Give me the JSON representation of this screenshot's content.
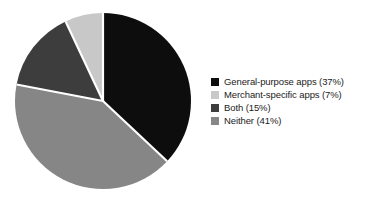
{
  "chart_data": {
    "type": "pie",
    "title": "",
    "subtitle": "",
    "xlabel": "",
    "ylabel": "",
    "legend_position": "right",
    "grid": false,
    "start_angle_deg": 0,
    "direction": "clockwise",
    "categories": [
      "General-purpose apps",
      "Merchant-specific apps",
      "Both",
      "Neither"
    ],
    "values": [
      37,
      7,
      15,
      41
    ],
    "value_unit": "%",
    "slice_order_clockwise_from_top": [
      "General-purpose apps",
      "Neither",
      "Both",
      "Merchant-specific apps"
    ],
    "slices": [
      {
        "label": "General-purpose apps",
        "value": 37,
        "display": "General-purpose apps (37%)",
        "color": "#0d0d0d"
      },
      {
        "label": "Merchant-specific apps",
        "value": 7,
        "display": "Merchant-specific apps (7%)",
        "color": "#c8c8c8"
      },
      {
        "label": "Both",
        "value": 15,
        "display": "Both (15%)",
        "color": "#3d3d3d"
      },
      {
        "label": "Neither",
        "value": 41,
        "display": "Neither (41%)",
        "color": "#868686"
      }
    ],
    "separator_color": "#ffffff",
    "background_color": "#ffffff"
  },
  "legend": {
    "items": [
      {
        "text": "General-purpose apps (37%)",
        "swatch_name": "legend-swatch-general-purpose-apps"
      },
      {
        "text": "Merchant-specific apps (7%)",
        "swatch_name": "legend-swatch-merchant-specific-apps"
      },
      {
        "text": "Both (15%)",
        "swatch_name": "legend-swatch-both"
      },
      {
        "text": "Neither (41%)",
        "swatch_name": "legend-swatch-neither"
      }
    ]
  }
}
